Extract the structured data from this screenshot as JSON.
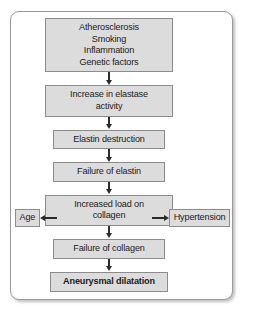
{
  "figure": {
    "type": "flowchart",
    "orientation": "top-to-bottom",
    "nodes": [
      {
        "id": "risk-factors",
        "lines": [
          "Atherosclerosis",
          "Smoking",
          "Inflammation",
          "Genetic factors"
        ],
        "emphasis": false
      },
      {
        "id": "elastase-activity",
        "lines": [
          "Increase in elastase",
          "activity"
        ],
        "emphasis": false
      },
      {
        "id": "elastin-destruction",
        "lines": [
          "Elastin destruction"
        ],
        "emphasis": false
      },
      {
        "id": "failure-of-elastin",
        "lines": [
          "Failure of elastin"
        ],
        "emphasis": false
      },
      {
        "id": "increased-load-on-collagen",
        "lines": [
          "Increased load on",
          "collagen"
        ],
        "emphasis": false
      },
      {
        "id": "failure-of-collagen",
        "lines": [
          "Failure of collagen"
        ],
        "emphasis": false
      },
      {
        "id": "aneurysmal-dilatation",
        "lines": [
          "Aneurysmal dilatation"
        ],
        "emphasis": true
      }
    ],
    "side_nodes": {
      "left": {
        "id": "age",
        "label": "Age"
      },
      "right": {
        "id": "hypertension",
        "label": "Hypertension"
      }
    },
    "colors": {
      "node_fill": "#dcdcdc",
      "node_border": "#8c8c8c",
      "arrow": "#2b2b2b",
      "panel_border": "#9a9a9a",
      "background": "#ffffff",
      "text": "#1b1b1b"
    }
  }
}
